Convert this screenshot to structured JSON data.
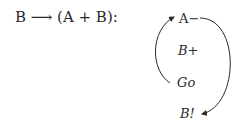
{
  "formula": "B ⟶ (A + B):",
  "nodes": [
    {
      "id": "a-minus",
      "label": "A−"
    },
    {
      "id": "b-plus",
      "label": "B+"
    },
    {
      "id": "go",
      "label": "Go"
    },
    {
      "id": "b-bang",
      "label": "B!"
    }
  ],
  "edges": [
    {
      "from": "Go",
      "to": "A−",
      "side": "left"
    },
    {
      "from": "A−",
      "to": "B!",
      "side": "right"
    }
  ],
  "colors": {
    "ink": "#2a2a2a",
    "background": "#ffffff"
  }
}
